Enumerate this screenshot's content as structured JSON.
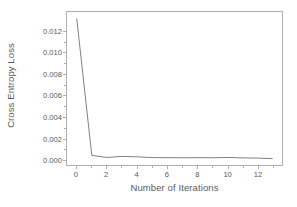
{
  "chart_data": {
    "type": "line",
    "title": "",
    "xlabel": "Number of Iterations",
    "ylabel": "Cross Entropy Loss",
    "x": [
      0,
      1,
      2,
      3,
      4,
      5,
      6,
      7,
      8,
      9,
      10,
      11,
      12,
      13
    ],
    "values": [
      0.0132,
      0.00035,
      0.00016,
      0.00026,
      0.00022,
      0.00015,
      0.00014,
      0.00013,
      0.00014,
      0.00013,
      0.00016,
      0.00012,
      0.0001,
      5e-05
    ],
    "series": [
      {
        "name": "Cross Entropy Loss",
        "values": [
          0.0132,
          0.00035,
          0.00016,
          0.00026,
          0.00022,
          0.00015,
          0.00014,
          0.00013,
          0.00014,
          0.00013,
          0.00016,
          0.00012,
          0.0001,
          5e-05
        ]
      }
    ],
    "xlim": [
      -0.65,
      13.65
    ],
    "ylim": [
      -0.00055,
      0.01385
    ],
    "xticks": [
      0,
      2,
      4,
      6,
      8,
      10,
      12
    ],
    "xtick_labels": [
      "0",
      "2",
      "4",
      "6",
      "8",
      "10",
      "12"
    ],
    "xticks_minor": [
      1,
      3,
      5,
      7,
      9,
      11,
      13
    ],
    "yticks": [
      0.0,
      0.002,
      0.004,
      0.006,
      0.008,
      0.01,
      0.012
    ],
    "ytick_labels": [
      "0.000",
      "0.002",
      "0.004",
      "0.006",
      "0.008",
      "0.010",
      "0.012"
    ],
    "grid": false,
    "legend": false,
    "legend_position": "none",
    "line_color": "#808080",
    "frame_color": "#b0b0b0",
    "text_color": "#595959",
    "background_color": "#ffffff",
    "line_width": 1.0
  }
}
